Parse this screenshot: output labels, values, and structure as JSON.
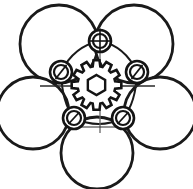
{
  "drawing": {
    "title": "Planetary roller mechanism assembly",
    "background_color": "#ffffff",
    "line_color": "#1a1a1a",
    "centerline_color": "#666666",
    "canvas": {
      "width": 193,
      "height": 189
    },
    "center": {
      "x": 96.5,
      "y": 90
    },
    "sun_gear": {
      "label": "sun-gear",
      "center": {
        "x": 96.5,
        "y": 85
      },
      "outer_radius": 25,
      "root_radius": 19,
      "tooth_count": 12,
      "bore_shape": "hexagon",
      "bore_radius": 10,
      "stroke_width": 2.6
    },
    "rollers": [
      {
        "label": "roller-top-left",
        "cx": 59,
        "cy": 44,
        "r": 39
      },
      {
        "label": "roller-top-right",
        "cx": 134,
        "cy": 44,
        "r": 39
      },
      {
        "label": "roller-left",
        "cx": 33,
        "cy": 113,
        "r": 36
      },
      {
        "label": "roller-right",
        "cx": 160,
        "cy": 113,
        "r": 36
      },
      {
        "label": "roller-bottom",
        "cx": 97,
        "cy": 153,
        "r": 36
      }
    ],
    "bearings": [
      {
        "label": "bearing-top",
        "cx": 100,
        "cy": 41,
        "r_outer": 11,
        "r_inner": 7,
        "marker": "crosshair"
      },
      {
        "label": "bearing-upper-left",
        "cx": 61,
        "cy": 72,
        "r_outer": 11,
        "r_inner": 7,
        "marker": "slash"
      },
      {
        "label": "bearing-upper-right",
        "cx": 137,
        "cy": 72,
        "r_outer": 11,
        "r_inner": 7,
        "marker": "slash"
      },
      {
        "label": "bearing-lower-left",
        "cx": 74,
        "cy": 118,
        "r_outer": 11,
        "r_inner": 7,
        "marker": "slash"
      },
      {
        "label": "bearing-lower-right",
        "cx": 123,
        "cy": 118,
        "r_outer": 11,
        "r_inner": 7,
        "marker": "slash"
      }
    ],
    "carrier_arcs": [
      {
        "label": "arc-top-left",
        "from": "bearing-upper-left",
        "to": "bearing-top"
      },
      {
        "label": "arc-top-right",
        "from": "bearing-top",
        "to": "bearing-upper-right"
      },
      {
        "label": "arc-left",
        "from": "bearing-lower-left",
        "to": "bearing-upper-left"
      },
      {
        "label": "arc-right",
        "from": "bearing-upper-right",
        "to": "bearing-lower-right"
      },
      {
        "label": "arc-bottom",
        "from": "bearing-lower-left",
        "to": "bearing-lower-right"
      }
    ],
    "centerlines": [
      {
        "label": "centerline-horizontal",
        "x1": 40,
        "y1": 86,
        "x2": 155,
        "y2": 86
      },
      {
        "label": "centerline-vertical",
        "x1": 100,
        "y1": 28,
        "x2": 100,
        "y2": 133
      },
      {
        "label": "centerline-bottom-tick",
        "x1": 78,
        "y1": 127,
        "x2": 122,
        "y2": 127
      }
    ]
  }
}
